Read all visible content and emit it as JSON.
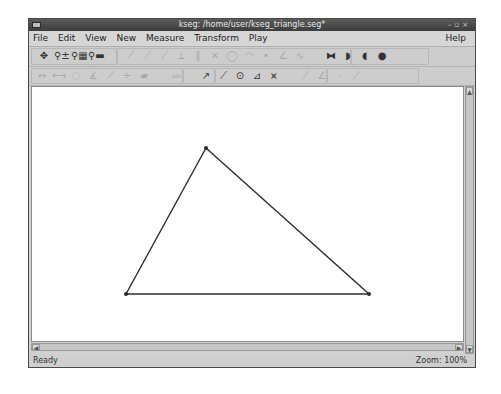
{
  "window": {
    "title": "kseg: /home/user/kseg_triangle.seg*",
    "controls": [
      "minimize",
      "maximize",
      "close"
    ]
  },
  "menubar": {
    "items": [
      {
        "label": "File",
        "mnemonic": "F"
      },
      {
        "label": "Edit",
        "mnemonic": "E"
      },
      {
        "label": "View",
        "mnemonic": "V"
      },
      {
        "label": "New",
        "mnemonic": "N"
      },
      {
        "label": "Measure",
        "mnemonic": "u"
      },
      {
        "label": "Transform",
        "mnemonic": "T"
      },
      {
        "label": "Play",
        "mnemonic": "y"
      }
    ],
    "help": "Help"
  },
  "toolbar": {
    "row1": [
      {
        "name": "move-tool",
        "glyph": "✥",
        "enabled": true
      },
      {
        "name": "zoom-in-out-tool",
        "glyph": "⚲±",
        "enabled": true
      },
      {
        "name": "zoom-fit-tool",
        "glyph": "⚲▦",
        "enabled": true
      },
      {
        "name": "zoom-reset-tool",
        "glyph": "⚲▬",
        "enabled": true
      },
      {
        "name": "segment-tool",
        "glyph": "⟋",
        "enabled": false
      },
      {
        "name": "ray-tool",
        "glyph": "⟋",
        "enabled": false
      },
      {
        "name": "line-tool",
        "glyph": "⟋",
        "enabled": false
      },
      {
        "name": "perpendicular-tool",
        "glyph": "⟂",
        "enabled": false
      },
      {
        "name": "parallel-tool",
        "glyph": "∥",
        "enabled": false
      },
      {
        "name": "intersection-tool",
        "glyph": "✕",
        "enabled": false
      },
      {
        "name": "circle-tool",
        "glyph": "◯",
        "enabled": false
      },
      {
        "name": "arc-tool",
        "glyph": "◠",
        "enabled": false
      },
      {
        "name": "midpoint-tool",
        "glyph": "•",
        "enabled": false
      },
      {
        "name": "angle-bisector-tool",
        "glyph": "∠",
        "enabled": false
      },
      {
        "name": "locus-tool",
        "glyph": "∿",
        "enabled": false
      },
      {
        "name": "polygon-fill-tool",
        "glyph": "⧓",
        "enabled": true
      },
      {
        "name": "circle-interior-tool",
        "glyph": "◗",
        "enabled": true
      },
      {
        "name": "arc-sector-tool",
        "glyph": "◖",
        "enabled": true
      },
      {
        "name": "arc-segment-tool",
        "glyph": "●",
        "enabled": true
      }
    ],
    "row2": [
      {
        "name": "distance-tool",
        "glyph": "↔",
        "enabled": false
      },
      {
        "name": "length-tool",
        "glyph": "⟷",
        "enabled": false
      },
      {
        "name": "radius-tool",
        "glyph": "◌",
        "enabled": false
      },
      {
        "name": "angle-measure-tool",
        "glyph": "∡",
        "enabled": false
      },
      {
        "name": "slope-tool",
        "glyph": "⟋",
        "enabled": false
      },
      {
        "name": "ratio-tool",
        "glyph": "÷",
        "enabled": false
      },
      {
        "name": "area-tool",
        "glyph": "▰",
        "enabled": false
      },
      {
        "name": "calculate-tool",
        "glyph": "abc",
        "enabled": false
      },
      {
        "name": "translate-tool",
        "glyph": "↗",
        "enabled": true
      },
      {
        "name": "rotate-tool",
        "glyph": "⟋",
        "enabled": true
      },
      {
        "name": "scale-tool",
        "glyph": "⊙",
        "enabled": true
      },
      {
        "name": "reflect-tool",
        "glyph": "⊿",
        "enabled": true
      },
      {
        "name": "iterate-tool",
        "glyph": "⩙",
        "enabled": true
      },
      {
        "name": "mark-vector-tool",
        "glyph": "⟋",
        "enabled": false
      },
      {
        "name": "mark-angle-tool",
        "glyph": "∠",
        "enabled": false
      },
      {
        "name": "mark-center-tool",
        "glyph": "·",
        "enabled": false
      },
      {
        "name": "mark-mirror-tool",
        "glyph": "⟋",
        "enabled": false
      }
    ]
  },
  "canvas": {
    "stroke_color": "#2b2b2b",
    "points": [
      {
        "id": "A",
        "x": 206,
        "y": 148
      },
      {
        "id": "B",
        "x": 126,
        "y": 294
      },
      {
        "id": "C",
        "x": 369,
        "y": 294
      }
    ],
    "segments": [
      [
        "A",
        "B"
      ],
      [
        "B",
        "C"
      ],
      [
        "C",
        "A"
      ]
    ]
  },
  "statusbar": {
    "status": "Ready",
    "zoom": "Zoom: 100%"
  }
}
